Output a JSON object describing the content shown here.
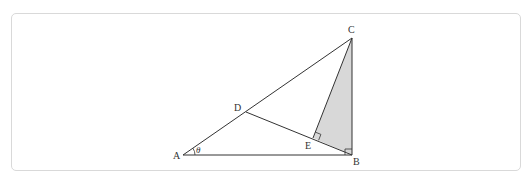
{
  "header": {
    "fragment": ""
  },
  "diagram": {
    "labels": {
      "A": "A",
      "B": "B",
      "C": "C",
      "D": "D",
      "E": "E",
      "theta": "θ"
    },
    "points": {
      "A": [
        183,
        155
      ],
      "B": [
        352,
        155
      ],
      "C": [
        352,
        38
      ],
      "D": [
        246,
        112
      ],
      "E": [
        313,
        138
      ]
    },
    "segments": [
      "AB",
      "AC",
      "BC",
      "DB",
      "CE"
    ],
    "shaded_region": "CEB",
    "right_angles": [
      "E",
      "B"
    ],
    "angle_marked": {
      "vertex": "A",
      "label": "θ"
    },
    "colors": {
      "stroke": "#333333",
      "shade": "#d8d8d8",
      "frame": "#d9d9d9"
    }
  }
}
